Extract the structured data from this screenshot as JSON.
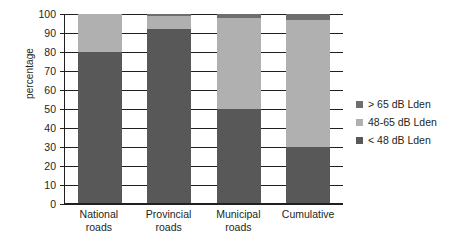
{
  "chart_data": {
    "type": "bar",
    "subtype": "stacked-bar-vertical-100pct",
    "title": "",
    "xlabel": "",
    "ylabel": "percentage",
    "ylim": [
      0,
      100
    ],
    "ytick_step": 10,
    "yticks": [
      100,
      90,
      80,
      70,
      60,
      50,
      40,
      30,
      20,
      10,
      0
    ],
    "ytick_labels": [
      "100",
      "90",
      "80",
      "70",
      "60",
      "50",
      "40",
      "30",
      "20",
      "10",
      "0"
    ],
    "grid": true,
    "grid_axis": "y",
    "legend_position": "right",
    "categories": [
      "National roads",
      "Provincial roads",
      "Municipal roads",
      "Cumulative"
    ],
    "category_lines": [
      [
        "National",
        "roads"
      ],
      [
        "Provincial",
        "roads"
      ],
      [
        "Municipal",
        "roads"
      ],
      [
        "Cumulative",
        ""
      ]
    ],
    "series": [
      {
        "name": "> 65 dB Lden",
        "color": "#6e6e6e",
        "values": [
          0,
          1,
          2,
          3
        ],
        "stack_order": 3
      },
      {
        "name": "48-65 dB Lden",
        "color": "#b0b0b0",
        "values": [
          20,
          7,
          48,
          67
        ],
        "stack_order": 2
      },
      {
        "name": "< 48 dB Lden",
        "color": "#585858",
        "values": [
          80,
          92,
          50,
          30
        ],
        "stack_order": 1
      }
    ],
    "segment_boundaries": {
      "National roads": [
        80,
        100,
        100
      ],
      "Provincial roads": [
        92,
        99,
        100
      ],
      "Municipal roads": [
        50,
        98,
        100
      ],
      "Cumulative": [
        30,
        97,
        100
      ]
    }
  },
  "axis": {
    "y_title": "percentage"
  },
  "legend": {
    "items": [
      {
        "label": "> 65 dB Lden",
        "color": "#6e6e6e"
      },
      {
        "label": "48-65 dB Lden",
        "color": "#b0b0b0"
      },
      {
        "label": "< 48 dB Lden",
        "color": "#585858"
      }
    ]
  },
  "colors": {
    "axis": "#231f20",
    "background": "#ffffff",
    "band_high": "#6e6e6e",
    "band_mid": "#b0b0b0",
    "band_low": "#585858"
  }
}
